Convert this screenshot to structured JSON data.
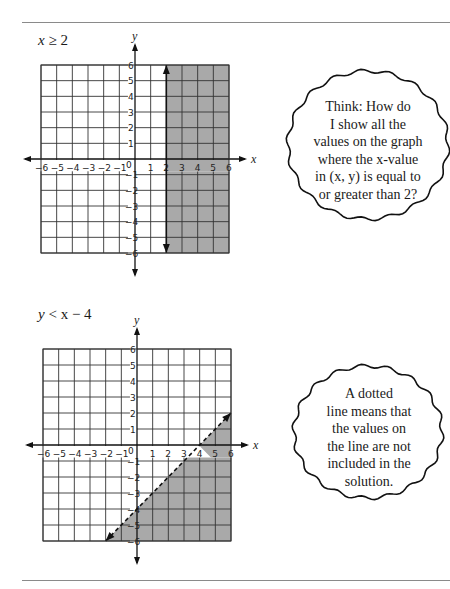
{
  "page": {
    "top_rule": true,
    "bottom_rule": true
  },
  "graphs": [
    {
      "title": "x ≥ 2",
      "title_var": "x",
      "title_rel": "≥ 2",
      "bubble": {
        "lines": [
          "Think: How do",
          "I show all the",
          "values on the graph",
          "where the x-value",
          "in (x, y) is equal to",
          "or greater than 2?"
        ]
      }
    },
    {
      "title": "y < x − 4",
      "title_var": "y",
      "title_rel": "< x − 4",
      "bubble": {
        "lines": [
          "A dotted",
          "line means that",
          "the values on",
          "the line are not",
          "included in the",
          "solution."
        ]
      }
    }
  ],
  "chart_data": [
    {
      "type": "inequality-graph",
      "title": "x ≥ 2",
      "xlabel": "x",
      "ylabel": "y",
      "xlim": [
        -6,
        6
      ],
      "ylim": [
        -6,
        6
      ],
      "x_ticks": [
        -6,
        -5,
        -4,
        -3,
        -2,
        -1,
        0,
        1,
        2,
        3,
        4,
        5,
        6
      ],
      "y_ticks": [
        -6,
        -5,
        -4,
        -3,
        -2,
        -1,
        1,
        2,
        3,
        4,
        5,
        6
      ],
      "grid": true,
      "boundary": {
        "equation": "x = 2",
        "style": "solid",
        "from": [
          2,
          -6
        ],
        "to": [
          2,
          6
        ],
        "arrows": "both"
      },
      "shaded_region": "x >= 2",
      "shade_color": "#a9a9a9"
    },
    {
      "type": "inequality-graph",
      "title": "y < x − 4",
      "xlabel": "x",
      "ylabel": "y",
      "xlim": [
        -6,
        6
      ],
      "ylim": [
        -6,
        6
      ],
      "x_ticks": [
        -6,
        -5,
        -4,
        -3,
        -2,
        -1,
        0,
        1,
        2,
        3,
        4,
        5,
        6
      ],
      "y_ticks": [
        -6,
        -5,
        -4,
        -3,
        -2,
        -1,
        1,
        2,
        3,
        4,
        5,
        6
      ],
      "grid": true,
      "boundary": {
        "equation": "y = x − 4",
        "style": "dashed",
        "from": [
          -2,
          -6
        ],
        "to": [
          6,
          2
        ],
        "arrows": "both"
      },
      "shaded_region": "y < x - 4",
      "shade_color": "#a9a9a9"
    }
  ]
}
